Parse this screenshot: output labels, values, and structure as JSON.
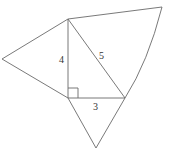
{
  "diagram": {
    "right_triangle": {
      "legs": {
        "vertical": "4",
        "horizontal": "3"
      },
      "hypotenuse": "5",
      "right_angle_marker": true
    },
    "labels": {
      "vertical_leg": "4",
      "hypotenuse": "5",
      "horizontal_leg": "3"
    },
    "colors": {
      "stroke": "#6a6a6a",
      "text": "#333333",
      "background": "#ffffff"
    }
  }
}
